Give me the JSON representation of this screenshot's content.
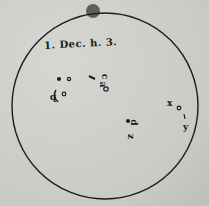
{
  "figure": {
    "date_label": "1. Dec. h. 3.",
    "spot_labels": [
      "b",
      "c",
      "a",
      "d",
      "z",
      "x",
      "y"
    ],
    "colors": {
      "ink": "#1c1c1c",
      "paper": "#cfcfcb"
    }
  }
}
